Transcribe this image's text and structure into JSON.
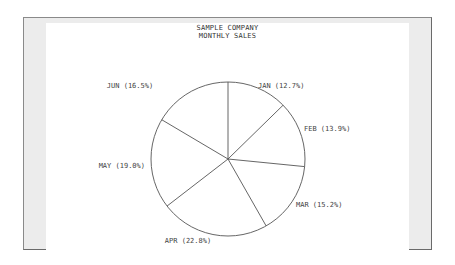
{
  "chart_data": {
    "type": "pie",
    "title": "SAMPLE COMPANY",
    "subtitle": "MONTHLY SALES",
    "categories": [
      "JAN",
      "FEB",
      "MAR",
      "APR",
      "MAY",
      "JUN"
    ],
    "values": [
      12.7,
      13.9,
      15.2,
      22.8,
      19.0,
      16.5
    ],
    "labels": [
      "JAN (12.7%)",
      "FEB (13.9%)",
      "MAR (15.2%)",
      "APR (22.8%)",
      "MAY (19.0%)",
      "JUN (16.5%)"
    ],
    "start_angle": "top",
    "direction": "clockwise",
    "colors": {
      "line": "#555555",
      "fill": "#ffffff",
      "frame": "#ececec"
    }
  }
}
